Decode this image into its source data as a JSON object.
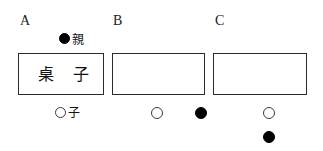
{
  "figure": {
    "panels": [
      {
        "label": "A",
        "box_text": "桌 子",
        "legend": [
          {
            "marker": "filled-circle",
            "caption": "親"
          },
          {
            "marker": "open-circle",
            "caption": "子"
          }
        ]
      },
      {
        "label": "B",
        "box_text": "",
        "legend": [
          {
            "marker": "open-circle",
            "caption": ""
          },
          {
            "marker": "filled-circle",
            "caption": ""
          }
        ]
      },
      {
        "label": "C",
        "box_text": "",
        "legend": [
          {
            "marker": "open-circle",
            "caption": ""
          },
          {
            "marker": "filled-circle",
            "caption": ""
          }
        ]
      }
    ],
    "colors": {
      "stroke": "#2b2b2b",
      "fill_marker": "#000000",
      "open_marker": "#ffffff",
      "text": "#111111",
      "background": "#ffffff"
    }
  }
}
